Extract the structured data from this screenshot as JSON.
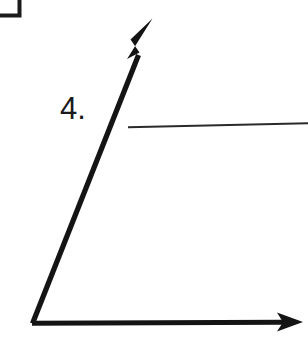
{
  "page": {
    "background_color": "#ffffff",
    "ink_color": "#151515",
    "width": 308,
    "height": 358
  },
  "problem": {
    "number_label": "4.",
    "scan_artifact": {
      "name": "box-corner-artifact",
      "description": "partial box corner",
      "color": "#1b1b1b"
    }
  },
  "answer_line": {
    "label": "",
    "placeholder": "",
    "value": "",
    "color": "#2a2a2a",
    "start_x": 128,
    "start_y": 127,
    "end_x": 308,
    "end_y": 123
  },
  "figure": {
    "type": "angle",
    "vertex": {
      "x": 32,
      "y": 323
    },
    "rays": [
      {
        "name": "ray-diagonal",
        "from_x": 32,
        "from_y": 323,
        "to_x": 152,
        "to_y": 19,
        "arrowhead": true,
        "stroke_width": 5,
        "color": "#141414"
      },
      {
        "name": "ray-horizontal",
        "from_x": 32,
        "from_y": 323,
        "to_x": 302,
        "to_y": 322,
        "arrowhead": true,
        "stroke_width": 5,
        "color": "#141414"
      }
    ]
  }
}
